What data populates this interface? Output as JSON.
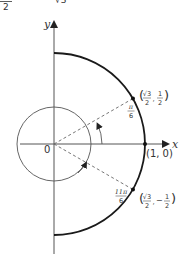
{
  "header_fragment": {
    "left_text": "2",
    "right_text": "√3"
  },
  "diagram": {
    "axes": {
      "x_label": "x",
      "y_label": "y",
      "origin_label": "0"
    },
    "points": [
      {
        "id": "one-zero",
        "label": "(1, 0)"
      },
      {
        "id": "pi-over-6",
        "label_x_num": "√3",
        "label_x_den": "2",
        "label_y_num": "1",
        "label_y_den": "2",
        "sep": ","
      },
      {
        "id": "eleven-pi-over-6",
        "label_x_num": "√3",
        "label_x_den": "2",
        "label_y_num": "1",
        "label_y_den": "2",
        "sign": "−",
        "sep": ","
      }
    ],
    "angles": [
      {
        "id": "pi-over-6",
        "num": "π",
        "den": "6"
      },
      {
        "id": "eleven-pi-over-6",
        "num": "11π",
        "den": "6"
      }
    ],
    "colors": {
      "arc": "#1a1a1a",
      "axis": "#555555",
      "dashed": "#666666",
      "text": "#333333"
    }
  }
}
